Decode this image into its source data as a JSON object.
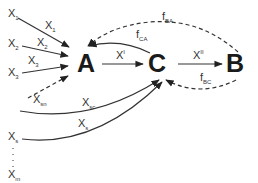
{
  "nodes": {
    "A": "A",
    "C": "C",
    "B": "B"
  },
  "inputs": {
    "x1": {
      "base": "X",
      "sub": "1"
    },
    "x2": {
      "base": "X",
      "sub": "2"
    },
    "x3": {
      "base": "X",
      "sub": "3"
    },
    "xs": {
      "base": "X",
      "sub": "s"
    },
    "xm": {
      "base": "X",
      "sub": "m"
    }
  },
  "edges": {
    "x1_to_A": {
      "base": "X",
      "sub": "1"
    },
    "x2_to_A": {
      "base": "X",
      "sub": "2"
    },
    "x3_to_A": {
      "base": "X",
      "sub": "3"
    },
    "xsn_to_A": {
      "base": "X",
      "sub": "sn"
    },
    "xsc_to_C": {
      "base": "X",
      "sub": "sc"
    },
    "xs_to_C": {
      "base": "X",
      "sub": "s"
    },
    "A_to_C": {
      "base": "X",
      "sup": "I"
    },
    "C_to_B": {
      "base": "X",
      "sup": "II"
    },
    "C_to_A_feedback": {
      "base": "f",
      "sub": "CA"
    },
    "B_to_A_feedback": {
      "base": "f",
      "sub": "BA"
    },
    "B_to_C_feedback": {
      "base": "f",
      "sub": "BC"
    }
  },
  "colors": {
    "stroke": "#333333",
    "node_text": "#1a1a1a",
    "background": "#ffffff"
  }
}
